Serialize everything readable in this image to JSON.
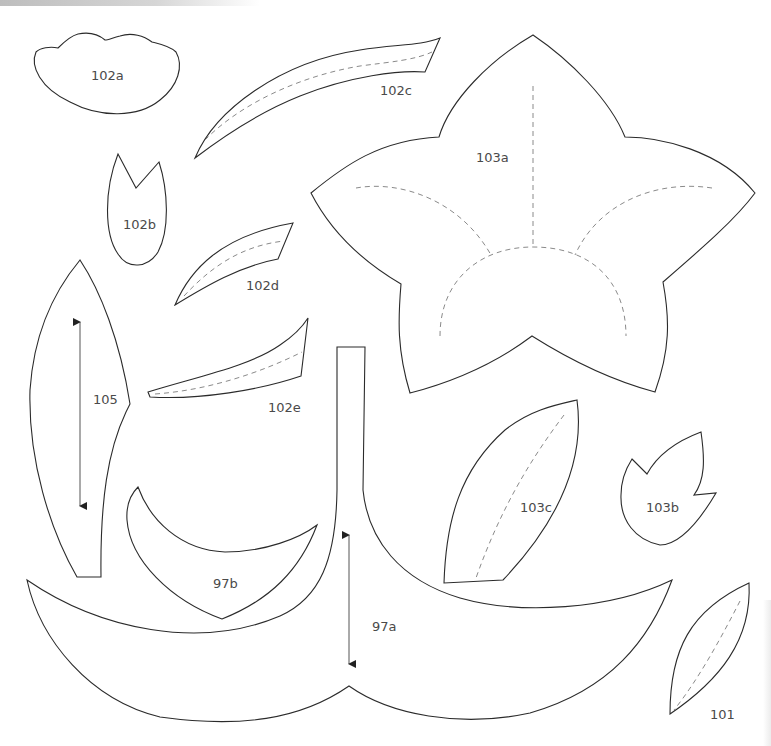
{
  "page": {
    "type": "sewing-template-sheet",
    "colors": {
      "outline": "#2b2b2b",
      "seam": "#8a8a8a",
      "label": "#4a4a4a",
      "background": "#ffffff"
    }
  },
  "pieces": [
    {
      "id": "102a",
      "label": "102a",
      "shape": "scalloped-cap",
      "seam_line": false,
      "grain_arrow": false
    },
    {
      "id": "102b",
      "label": "102b",
      "shape": "tulip-bud",
      "seam_line": false,
      "grain_arrow": false
    },
    {
      "id": "102c",
      "label": "102c",
      "shape": "curved-strip-long",
      "seam_line": true,
      "grain_arrow": false
    },
    {
      "id": "102d",
      "label": "102d",
      "shape": "curved-strip-short",
      "seam_line": true,
      "grain_arrow": false
    },
    {
      "id": "102e",
      "label": "102e",
      "shape": "curved-strip-thin",
      "seam_line": true,
      "grain_arrow": false
    },
    {
      "id": "103a",
      "label": "103a",
      "shape": "five-petal-flower",
      "seam_line": true,
      "grain_arrow": false
    },
    {
      "id": "103b",
      "label": "103b",
      "shape": "three-point-bud",
      "seam_line": false,
      "grain_arrow": false
    },
    {
      "id": "103c",
      "label": "103c",
      "shape": "leaf-large",
      "seam_line": true,
      "grain_arrow": false
    },
    {
      "id": "105",
      "label": "105",
      "shape": "long-leaf",
      "seam_line": false,
      "grain_arrow": true
    },
    {
      "id": "97a",
      "label": "97a",
      "shape": "stem-with-leaves",
      "seam_line": false,
      "grain_arrow": true
    },
    {
      "id": "97b",
      "label": "97b",
      "shape": "crescent-leaf",
      "seam_line": false,
      "grain_arrow": false
    },
    {
      "id": "101",
      "label": "101",
      "shape": "leaf-small",
      "seam_line": true,
      "grain_arrow": false
    }
  ]
}
